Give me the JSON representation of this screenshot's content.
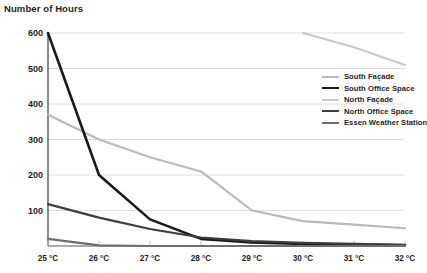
{
  "chart_data": {
    "type": "line",
    "title": "Number of Hours",
    "ylabel": "Number of Hours",
    "xlabel": "",
    "categories": [
      "25 °C",
      "26 °C",
      "27 °C",
      "28 °C",
      "29 °C",
      "30 °C",
      "31 °C",
      "32 °C"
    ],
    "x_values": [
      25,
      26,
      27,
      28,
      29,
      30,
      31,
      32
    ],
    "ylim": [
      0,
      600
    ],
    "yticks": [
      0,
      100,
      200,
      300,
      400,
      500,
      600
    ],
    "ytick_labels": [
      "",
      "100",
      "200",
      "300",
      "400",
      "500",
      "600"
    ],
    "grid": "horizontal",
    "legend_position": "right",
    "series": [
      {
        "name": "South Façade",
        "color": "#b9b9b9",
        "width": 2.2,
        "values": [
          370,
          300,
          250,
          210,
          100,
          70,
          60,
          50
        ]
      },
      {
        "name": "South Office Space",
        "color": "#1a1a1a",
        "width": 2.6,
        "values": [
          600,
          200,
          75,
          20,
          10,
          6,
          4,
          2
        ]
      },
      {
        "name": "North Façade",
        "color": "#c8c8c8",
        "width": 2.2,
        "values": [
          null,
          null,
          null,
          null,
          null,
          600,
          560,
          510
        ]
      },
      {
        "name": "North Office Space",
        "color": "#3d3d3d",
        "width": 2.2,
        "values": [
          118,
          80,
          48,
          24,
          14,
          9,
          6,
          3
        ]
      },
      {
        "name": "Essen Weather Station",
        "color": "#6e6e6e",
        "width": 2.2,
        "values": [
          20,
          2,
          0,
          0,
          0,
          0,
          0,
          0
        ]
      }
    ]
  }
}
